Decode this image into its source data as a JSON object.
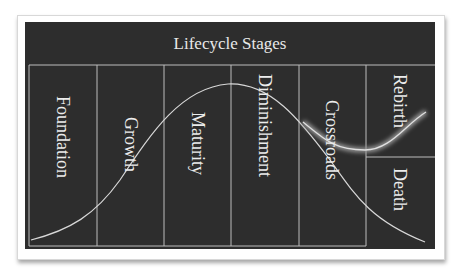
{
  "diagram": {
    "title": "Lifecycle Stages",
    "stages": [
      {
        "label": "Foundation"
      },
      {
        "label": "Growth"
      },
      {
        "label": "Maturity"
      },
      {
        "label": "Diminishment"
      },
      {
        "label": "Crossroads"
      },
      {
        "label": "Rebirth"
      },
      {
        "label": "Death"
      }
    ],
    "colors": {
      "background": "#2d2d2d",
      "line": "#cfcfcf",
      "text": "#ececec",
      "glow": "#bdbdbd"
    }
  }
}
